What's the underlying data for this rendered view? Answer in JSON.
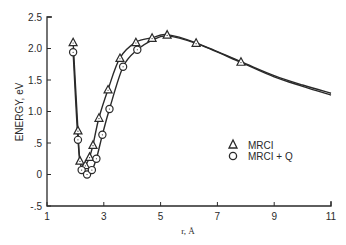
{
  "chart_data": {
    "type": "line",
    "title": "",
    "xlabel": "r, Å",
    "ylabel": "ENERGY, eV",
    "xlim": [
      1,
      11
    ],
    "ylim": [
      -0.5,
      2.5
    ],
    "x_ticks": [
      1,
      3,
      5,
      7,
      9,
      11
    ],
    "x_tick_labels": [
      "1",
      "3",
      "5",
      "7",
      "9",
      "11"
    ],
    "y_ticks": [
      -0.5,
      0,
      0.5,
      1.0,
      1.5,
      2.0,
      2.5
    ],
    "y_tick_labels": [
      "-.5",
      "0",
      ".5",
      "1.0",
      "1.5",
      "2.0",
      "2.5"
    ],
    "grid": false,
    "legend_position": "right-middle",
    "series": [
      {
        "name": "MRCI",
        "marker": "triangle",
        "x": [
          1.92,
          2.09,
          2.16,
          2.35,
          2.5,
          2.62,
          2.83,
          3.15,
          3.57,
          4.13,
          4.7,
          5.23,
          6.25,
          7.83
        ],
        "y": [
          2.1,
          0.7,
          0.22,
          0.15,
          0.28,
          0.47,
          0.9,
          1.35,
          1.85,
          2.1,
          2.17,
          2.22,
          2.09,
          1.79
        ],
        "curve_extension": {
          "x": [
            9,
            10,
            11
          ],
          "y": [
            1.57,
            1.42,
            1.29
          ]
        }
      },
      {
        "name": "MRCI + Q",
        "marker": "circle",
        "x": [
          1.92,
          2.09,
          2.22,
          2.41,
          2.58,
          2.74,
          2.95,
          3.2,
          3.68,
          4.18
        ],
        "y": [
          1.94,
          0.55,
          0.07,
          0.0,
          0.07,
          0.25,
          0.63,
          1.04,
          1.71,
          1.98
        ],
        "curve_extension": {
          "x": [
            4.7,
            5.23,
            6.25,
            7.83,
            9,
            10,
            11
          ],
          "y": [
            2.13,
            2.2,
            2.08,
            1.78,
            1.55,
            1.4,
            1.26
          ]
        }
      }
    ]
  },
  "legend": {
    "items": [
      {
        "symbol": "triangle",
        "label": "MRCI"
      },
      {
        "symbol": "circle",
        "label": "MRCI + Q"
      }
    ]
  },
  "axes": {
    "xlabel": "r, Å",
    "ylabel": "ENERGY, eV",
    "x_tick_labels": [
      "1",
      "3",
      "5",
      "7",
      "9",
      "11"
    ],
    "y_tick_labels": [
      "2.5",
      "2.0",
      "1.5",
      "1.0",
      ".5",
      "0",
      "-.5"
    ]
  },
  "colors": {
    "ink": "#2a2a2a",
    "background": "#ffffff"
  }
}
